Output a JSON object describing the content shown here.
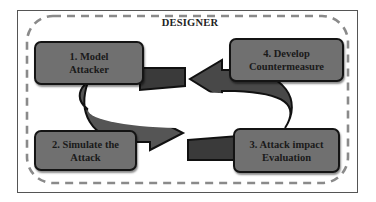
{
  "diagram": {
    "title": "DESIGNER",
    "steps": [
      {
        "id": 1,
        "lines": [
          "1. Model",
          "Attacker"
        ]
      },
      {
        "id": 2,
        "lines": [
          "2. Simulate the",
          "Attack"
        ]
      },
      {
        "id": 3,
        "lines": [
          "3. Attack impact",
          "Evaluation"
        ]
      },
      {
        "id": 4,
        "lines": [
          "4. Develop",
          "Countermeasure"
        ]
      }
    ],
    "flow": [
      "1. Model Attacker",
      "2. Simulate the Attack",
      "3. Attack impact Evaluation",
      "4. Develop Countermeasure",
      "1. Model Attacker"
    ],
    "colors": {
      "box_fill": "#707070",
      "box_border": "#141414",
      "arrow_fill": "#4a4a4a",
      "arrow_dark": "#333333",
      "dash": "#8a8a8a",
      "frame": "#555555"
    }
  }
}
